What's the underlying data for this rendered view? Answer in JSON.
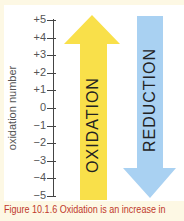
{
  "figure": {
    "axis_label": "oxidation number",
    "ticks": [
      "+5",
      "+4",
      "+3",
      "+2",
      "+1",
      "0",
      "−1",
      "−2",
      "−3",
      "−4",
      "−5"
    ],
    "oxidation_label": "OXIDATION",
    "reduction_label": "REDUCTION",
    "colors": {
      "oxidation": "#f9e04a",
      "reduction": "#a9d1f2",
      "caption": "#c0392b"
    },
    "caption": "Figure 10.1.6 Oxidation is an increase in"
  }
}
